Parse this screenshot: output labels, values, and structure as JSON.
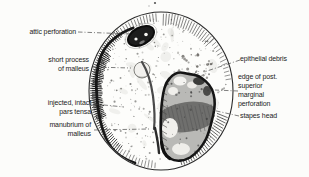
{
  "figure": {
    "kind": "otoscopic-view-line-drawing",
    "labels": [
      {
        "id": "attic-perforation",
        "text": "attic perforation"
      },
      {
        "id": "short-process-of-malleus",
        "text": "short process\nof malleus"
      },
      {
        "id": "injected-intact-pars-tensa",
        "text": "injected, intact\npars tensa"
      },
      {
        "id": "manubrium-of-malleus",
        "text": "manubrium of\nmalleus"
      },
      {
        "id": "epithelial-debris",
        "text": "epithelial debris"
      },
      {
        "id": "edge-of-post-superior-marginal-perforation",
        "text": "edge of post.\nsuperior\nmarginal\nperforation"
      },
      {
        "id": "stapes-head",
        "text": "stapes head"
      }
    ],
    "colors": {
      "ink": "#1b1b1b",
      "background": "#fcfcfa",
      "membrane": "#fdfdfb",
      "debris_gray": "#b9b9b6",
      "leader": "#3c3c3c"
    }
  }
}
